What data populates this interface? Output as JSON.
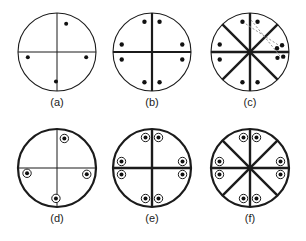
{
  "figure": {
    "background_color": "#ffffff",
    "line_color": "#1b1b1b",
    "dash_color": "#8a8a8a",
    "marker_fill": "#111111",
    "panel_count": 6
  },
  "panels": [
    {
      "id": "a",
      "label": "(a)",
      "cx": 57,
      "cy": 52,
      "r": 39,
      "circle_stroke": 1.1,
      "spoke_stroke": 1.0,
      "spokes_deg": [
        0,
        90
      ],
      "marker_style": "solid-dot",
      "marker_r": 2.0,
      "markers_deg": [
        72,
        350,
        190,
        268
      ],
      "marker_radius_frac": 0.76,
      "dashed_arrows": []
    },
    {
      "id": "b",
      "label": "(b)",
      "cx": 152,
      "cy": 52,
      "r": 39,
      "circle_stroke": 1.1,
      "spoke_stroke": 2.2,
      "spokes_deg": [
        0,
        90
      ],
      "marker_style": "solid-dot",
      "marker_r": 2.2,
      "markers_deg": [
        76,
        104,
        166,
        194,
        256,
        284,
        346,
        14
      ],
      "marker_radius_frac": 0.8,
      "dashed_arrows": []
    },
    {
      "id": "c",
      "label": "(c)",
      "cx": 250,
      "cy": 52,
      "r": 39,
      "circle_stroke": 1.1,
      "spoke_stroke": 2.4,
      "spokes_deg": [
        0,
        45,
        90,
        135
      ],
      "marker_style": "solid-dot",
      "marker_r": 2.2,
      "markers_deg": [
        76,
        104,
        166,
        194,
        256,
        284
      ],
      "marker_radius_frac": 0.8,
      "drifted_markers": [
        {
          "deg": 12,
          "radius_frac": 0.84
        },
        {
          "deg": 8,
          "radius_frac": 0.7
        },
        {
          "deg": 352,
          "radius_frac": 0.86
        },
        {
          "deg": 348,
          "radius_frac": 0.72
        }
      ],
      "dashed_arrows": [
        {
          "from_deg": 104,
          "from_frac": 0.8,
          "to_deg": 13,
          "to_frac": 0.76
        },
        {
          "from_deg": 88,
          "from_frac": 0.82,
          "to_deg": 352,
          "to_frac": 0.78
        }
      ]
    },
    {
      "id": "d",
      "label": "(d)",
      "cx": 57,
      "cy": 168,
      "r": 39,
      "circle_stroke": 2.2,
      "spoke_stroke": 1.0,
      "spokes_deg": [
        0,
        90
      ],
      "marker_style": "ringed-dot",
      "marker_r": 2.0,
      "marker_ring_r": 4.2,
      "markers_deg": [
        76,
        348,
        190,
        268
      ],
      "marker_radius_frac": 0.78,
      "dashed_arrows": []
    },
    {
      "id": "e",
      "label": "(e)",
      "cx": 152,
      "cy": 168,
      "r": 39,
      "circle_stroke": 2.2,
      "spoke_stroke": 2.4,
      "spokes_deg": [
        0,
        90
      ],
      "marker_style": "ringed-dot",
      "marker_r": 2.0,
      "marker_ring_r": 4.2,
      "markers_deg": [
        78,
        102,
        168,
        192,
        258,
        282,
        348,
        12
      ],
      "marker_radius_frac": 0.8,
      "dashed_arrows": []
    },
    {
      "id": "f",
      "label": "(f)",
      "cx": 250,
      "cy": 168,
      "r": 39,
      "circle_stroke": 2.2,
      "spoke_stroke": 2.4,
      "spokes_deg": [
        0,
        45,
        90,
        135
      ],
      "marker_style": "ringed-dot",
      "marker_r": 2.0,
      "marker_ring_r": 4.2,
      "markers_deg": [
        78,
        102,
        168,
        192,
        258,
        282,
        348,
        12
      ],
      "marker_radius_frac": 0.8,
      "dashed_arrows": []
    }
  ],
  "labels": {
    "a": "(a)",
    "b": "(b)",
    "c": "(c)",
    "d": "(d)",
    "e": "(e)",
    "f": "(f)"
  }
}
